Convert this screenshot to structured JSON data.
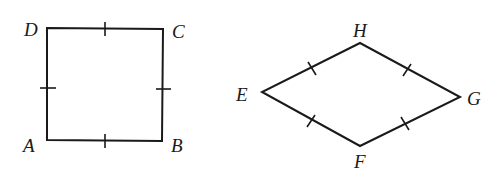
{
  "diagram": {
    "square": {
      "labels": {
        "A": "A",
        "B": "B",
        "C": "C",
        "D": "D"
      }
    },
    "rhombus": {
      "labels": {
        "E": "E",
        "F": "F",
        "G": "G",
        "H": "H"
      }
    },
    "stroke_color": "#1a1a1a",
    "background": "#ffffff"
  }
}
